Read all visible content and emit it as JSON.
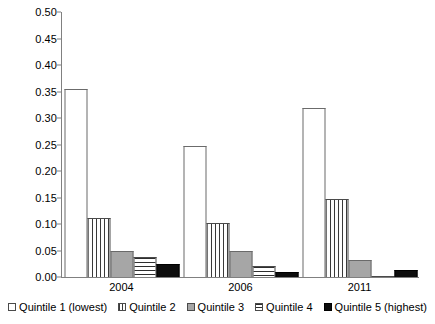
{
  "chart_data": {
    "type": "bar",
    "title": "",
    "subtitle": "",
    "xlabel": "",
    "ylabel": "",
    "categories": [
      "2004",
      "2006",
      "2011"
    ],
    "series": [
      {
        "name": "Quintile 1 (lowest)",
        "values": [
          0.355,
          0.248,
          0.319
        ],
        "swatch": "white-outline"
      },
      {
        "name": "Quintile 2",
        "values": [
          0.111,
          0.102,
          0.147
        ],
        "swatch": "vertical-stripes"
      },
      {
        "name": "Quintile 3",
        "values": [
          0.05,
          0.05,
          0.032
        ],
        "swatch": "solid-gray"
      },
      {
        "name": "Quintile 4",
        "values": [
          0.037,
          0.021,
          0.002
        ],
        "swatch": "horizontal-stripes"
      },
      {
        "name": "Quintile 5 (highest)",
        "values": [
          0.025,
          0.009,
          0.014
        ],
        "swatch": "solid-black"
      }
    ],
    "ylim": [
      0.0,
      0.5
    ],
    "ytick_values": [
      0.0,
      0.05,
      0.1,
      0.15,
      0.2,
      0.25,
      0.3,
      0.35,
      0.4,
      0.45,
      0.5
    ],
    "ytick_labels": [
      "0.00",
      "0.05",
      "0.10",
      "0.15",
      "0.20",
      "0.25",
      "0.30",
      "0.35",
      "0.40",
      "0.45",
      "0.50"
    ],
    "grid": false,
    "legend_position": "bottom",
    "annotations": []
  },
  "axis": {
    "y_ticks": [
      "0.50",
      "0.45",
      "0.40",
      "0.35",
      "0.30",
      "0.25",
      "0.20",
      "0.15",
      "0.10",
      "0.05",
      "0.00"
    ],
    "x_labels": [
      "2004",
      "2006",
      "2011"
    ]
  },
  "legend": {
    "items": [
      {
        "label": "Quintile 1 (lowest)"
      },
      {
        "label": "Quintile 2"
      },
      {
        "label": "Quintile 3"
      },
      {
        "label": "Quintile 4"
      },
      {
        "label": "Quintile 5 (highest)"
      }
    ]
  },
  "colors": {
    "axis": "#808080",
    "bar_outline": "#5a5a5a",
    "gray_fill": "#a6a6a6",
    "black_fill": "#0d0d0d",
    "text": "#000000",
    "background": "#ffffff"
  }
}
